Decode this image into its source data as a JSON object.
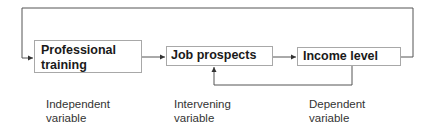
{
  "diagram": {
    "nodes": [
      {
        "id": "professional-training",
        "label": "Professional training",
        "line1": "Professional",
        "line2": "training"
      },
      {
        "id": "job-prospects",
        "label": "Job prospects"
      },
      {
        "id": "income-level",
        "label": "Income level"
      }
    ],
    "captions": [
      {
        "line1": "Independent",
        "line2": "variable"
      },
      {
        "line1": "Intervening",
        "line2": "variable"
      },
      {
        "line1": "Dependent",
        "line2": "variable"
      }
    ],
    "edges": [
      {
        "from": "professional-training",
        "to": "job-prospects"
      },
      {
        "from": "job-prospects",
        "to": "income-level"
      },
      {
        "from": "income-level",
        "to": "job-prospects",
        "type": "feedback"
      },
      {
        "from": "income-level",
        "to": "professional-training",
        "type": "feedback"
      }
    ],
    "colors": {
      "line": "#555555",
      "box_border": "#a8a8a8"
    }
  }
}
